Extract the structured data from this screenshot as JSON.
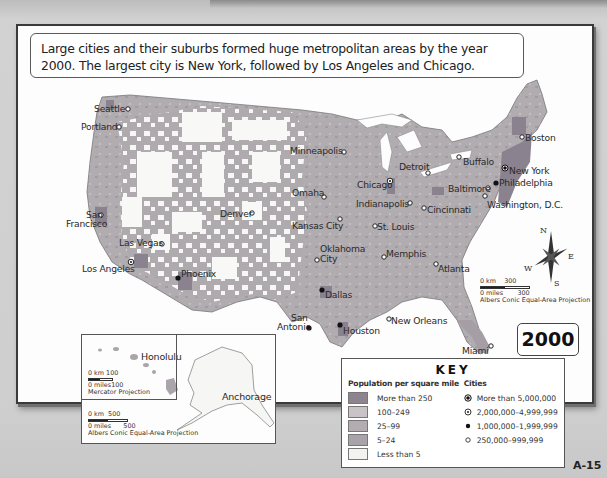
{
  "caption": {
    "line1": "Large cities and their suburbs formed huge metropolitan areas by the year",
    "line2": "2000. The largest city is New York, followed by Los Angeles and Chicago."
  },
  "year": "2000",
  "page_number": "A-15",
  "cities": [
    {
      "name": "Seattle",
      "size": "250,000-999,999"
    },
    {
      "name": "Portland",
      "size": "250,000-999,999"
    },
    {
      "name": "San Francisco",
      "size": "250,000-999,999"
    },
    {
      "name": "Las Vegas",
      "size": "250,000-999,999"
    },
    {
      "name": "Los Angeles",
      "size": "2,000,000-4,999,999"
    },
    {
      "name": "Phoenix",
      "size": "1,000,000-1,999,999"
    },
    {
      "name": "Denver",
      "size": "250,000-999,999"
    },
    {
      "name": "Minneapolis",
      "size": "250,000-999,999"
    },
    {
      "name": "Omaha",
      "size": "250,000-999,999"
    },
    {
      "name": "Kansas City",
      "size": "250,000-999,999"
    },
    {
      "name": "Oklahoma City",
      "size": "250,000-999,999"
    },
    {
      "name": "Dallas",
      "size": "1,000,000-1,999,999"
    },
    {
      "name": "San Antonio",
      "size": "1,000,000-1,999,999"
    },
    {
      "name": "Houston",
      "size": "1,000,000-1,999,999"
    },
    {
      "name": "Chicago",
      "size": "2,000,000-4,999,999"
    },
    {
      "name": "Detroit",
      "size": "250,000-999,999"
    },
    {
      "name": "Indianapolis",
      "size": "250,000-999,999"
    },
    {
      "name": "St. Louis",
      "size": "250,000-999,999"
    },
    {
      "name": "Cincinnati",
      "size": "250,000-999,999"
    },
    {
      "name": "Memphis",
      "size": "250,000-999,999"
    },
    {
      "name": "Atlanta",
      "size": "250,000-999,999"
    },
    {
      "name": "New Orleans",
      "size": "250,000-999,999"
    },
    {
      "name": "Miami",
      "size": "250,000-999,999"
    },
    {
      "name": "Buffalo",
      "size": "250,000-999,999"
    },
    {
      "name": "Boston",
      "size": "250,000-999,999"
    },
    {
      "name": "New York",
      "size": "More than 5,000,000"
    },
    {
      "name": "Philadelphia",
      "size": "1,000,000-1,999,999"
    },
    {
      "name": "Baltimore",
      "size": "250,000-999,999"
    },
    {
      "name": "Washington, D.C.",
      "size": "250,000-999,999"
    },
    {
      "name": "Honolulu",
      "size": "250,000-999,999"
    },
    {
      "name": "Anchorage",
      "size": "250,000-999,999"
    }
  ],
  "labels": {
    "seattle": "Seattle",
    "portland": "Portland",
    "san_francisco_1": "San",
    "san_francisco_2": "Francisco",
    "las_vegas": "Las Vegas",
    "los_angeles": "Los Angeles",
    "phoenix": "Phoenix",
    "denver": "Denver",
    "minneapolis": "Minneapolis",
    "omaha": "Omaha",
    "kansas_city": "Kansas City",
    "oklahoma_city_1": "Oklahoma",
    "oklahoma_city_2": "City",
    "dallas": "Dallas",
    "san_antonio_1": "San",
    "san_antonio_2": "Antonio",
    "houston": "Houston",
    "chicago": "Chicago",
    "detroit": "Detroit",
    "indianapolis": "Indianapolis",
    "st_louis": "St. Louis",
    "cincinnati": "Cincinnati",
    "memphis": "Memphis",
    "atlanta": "Atlanta",
    "new_orleans": "New Orleans",
    "miami": "Miami",
    "buffalo": "Buffalo",
    "boston": "Boston",
    "new_york": "New York",
    "philadelphia": "Philadelphia",
    "baltimore": "Baltimore",
    "washington": "Washington, D.C.",
    "honolulu": "Honolulu",
    "anchorage": "Anchorage"
  },
  "compass": {
    "n": "N",
    "s": "S",
    "e": "E",
    "w": "W"
  },
  "scales": {
    "main": {
      "km_label": "0 km",
      "km_value": "300",
      "mi_label": "0 miles",
      "mi_value": "300",
      "projection": "Albers Conic Equal-Area Projection"
    },
    "hawaii": {
      "km_label": "0 km",
      "km_value": "100",
      "mi_label": "0 miles",
      "mi_value": "100",
      "projection": "Mercator Projection"
    },
    "alaska": {
      "km_label": "0 km",
      "km_value": "500",
      "mi_label": "0 miles",
      "mi_value": "500",
      "projection": "Albers Conic Equal-Area Projection"
    }
  },
  "key": {
    "title": "KEY",
    "density_heading": "Population per square mile",
    "density": [
      {
        "label": "More than 250",
        "color": "#8e8490"
      },
      {
        "label": "100–249",
        "color": "#c9c2c6"
      },
      {
        "label": "25–99",
        "color": "#b3adb2"
      },
      {
        "label": "5–24",
        "color": "#a8a3a8"
      },
      {
        "label": "Less than 5",
        "color": "#f2f2f0"
      }
    ],
    "cities_heading": "Cities",
    "cities": [
      {
        "label": "More than 5,000,000",
        "symbol": "dot-in-ring-filled"
      },
      {
        "label": "2,000,000–4,999,999",
        "symbol": "dot-in-ring"
      },
      {
        "label": "1,000,000–1,999,999",
        "symbol": "filled-dot"
      },
      {
        "label": "250,000–999,999",
        "symbol": "open-circle"
      }
    ]
  },
  "colors": {
    "dense": "#8e8490",
    "high": "#c2bcc0",
    "mid": "#b0abaf",
    "low": "#a9a5a9",
    "sparse": "#f7f7f5",
    "frame": "#3a3a3a"
  }
}
